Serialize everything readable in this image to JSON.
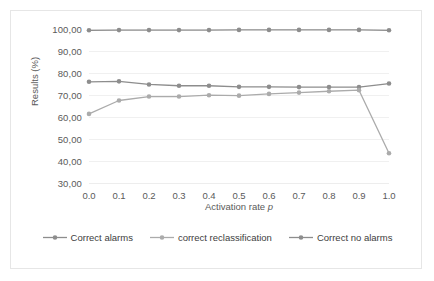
{
  "chart_data": {
    "type": "line",
    "title": "",
    "xlabel": "Activation rate p",
    "xlabel_plain": "Activation rate ",
    "xlabel_italic": "p",
    "ylabel": "Results (%)",
    "categories": [
      "0.0",
      "0.1",
      "0.2",
      "0.3",
      "0.4",
      "0.5",
      "0.6",
      "0.7",
      "0.8",
      "0.9",
      "1.0"
    ],
    "x": [
      0.0,
      0.1,
      0.2,
      0.3,
      0.4,
      0.5,
      0.6,
      0.7,
      0.8,
      0.9,
      1.0
    ],
    "ylim": [
      30,
      100
    ],
    "ytick_labels": [
      "100,00",
      "90,00",
      "80,00",
      "70,00",
      "60,00",
      "50,00",
      "40,00",
      "30,00"
    ],
    "ytick_values": [
      100,
      90,
      80,
      70,
      60,
      50,
      40,
      30
    ],
    "grid": true,
    "legend_position": "bottom",
    "series": [
      {
        "name": "Correct alarms",
        "color": "#8d8d8d",
        "values": [
          76.0,
          76.2,
          74.8,
          74.2,
          74.2,
          73.7,
          73.7,
          73.6,
          73.6,
          73.6,
          75.2
        ]
      },
      {
        "name": "correct reclassification",
        "color": "#ababab",
        "values": [
          61.4,
          67.5,
          69.3,
          69.3,
          69.9,
          69.7,
          70.5,
          71.1,
          71.7,
          72.2,
          43.5
        ]
      },
      {
        "name": "Correct no alarms",
        "color": "#8d8d8d",
        "values": [
          99.4,
          99.5,
          99.5,
          99.5,
          99.5,
          99.6,
          99.6,
          99.6,
          99.6,
          99.6,
          99.4
        ]
      }
    ]
  },
  "legend": {
    "items": [
      {
        "label": "Correct alarms",
        "color": "#8d8d8d"
      },
      {
        "label": "correct reclassification",
        "color": "#ababab"
      },
      {
        "label": "Correct no alarms",
        "color": "#8d8d8d"
      }
    ]
  },
  "colors": {
    "card_border": "#e6e6e6",
    "gridline": "#f0f0f0",
    "tick_text": "#5a5a5a",
    "legend_text": "#3d3d3d",
    "background": "#ffffff"
  }
}
